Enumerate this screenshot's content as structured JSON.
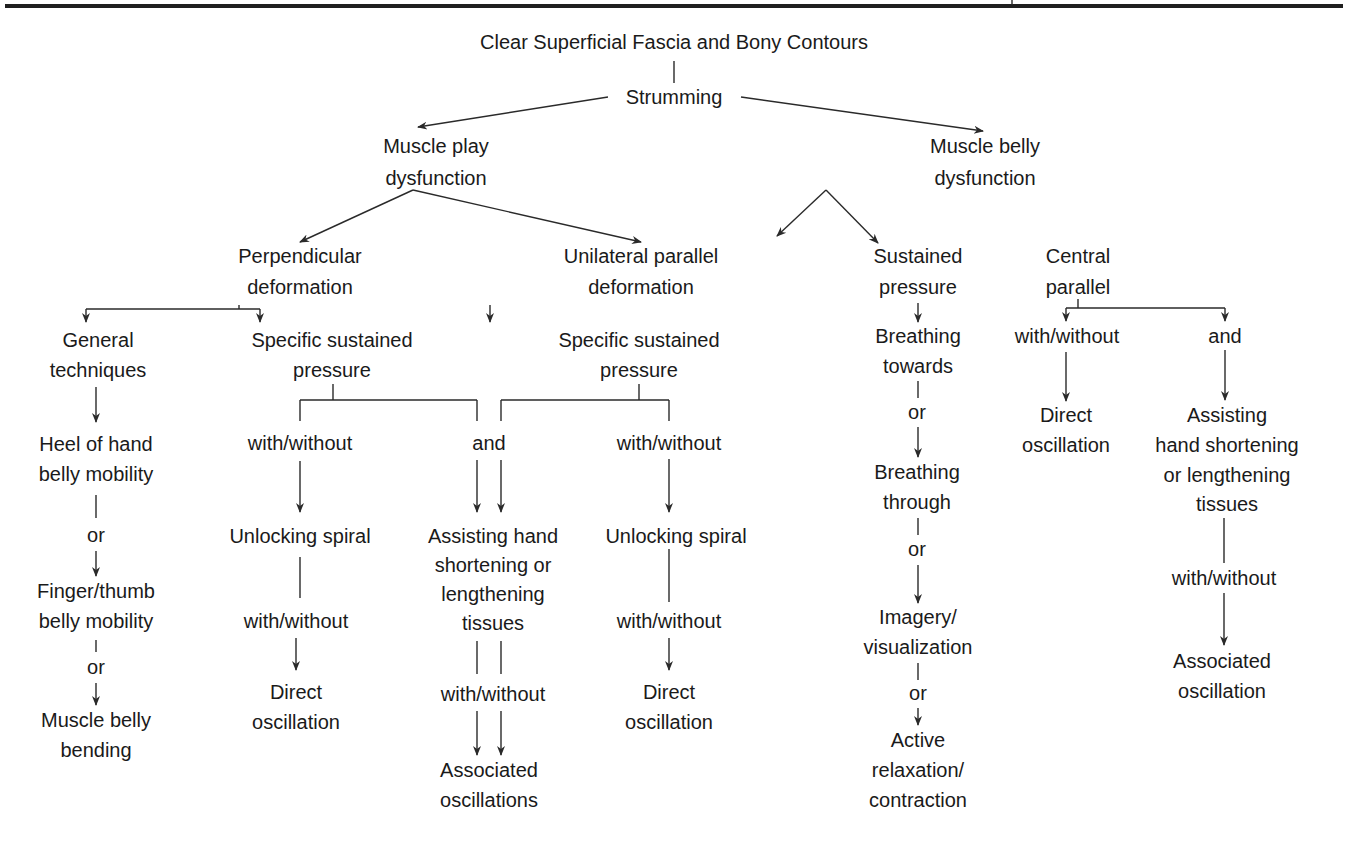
{
  "diagram": {
    "title": "Clear Superficial Fascia and Bony Contours",
    "strumming": "Strumming",
    "muscle_play": [
      "Muscle play",
      "dysfunction"
    ],
    "muscle_belly": [
      "Muscle belly",
      "dysfunction"
    ],
    "perpendicular": [
      "Perpendicular",
      "deformation"
    ],
    "unilateral": [
      "Unilateral parallel",
      "deformation"
    ],
    "general": [
      "General",
      "techniques"
    ],
    "specific_left": [
      "Specific sustained",
      "pressure"
    ],
    "specific_right": [
      "Specific sustained",
      "pressure"
    ],
    "heel": [
      "Heel of hand",
      "belly mobility"
    ],
    "or_1": "or",
    "finger": [
      "Finger/thumb",
      "belly mobility"
    ],
    "or_2": "or",
    "bending": [
      "Muscle belly",
      "bending"
    ],
    "ww_left": "with/without",
    "and_mid": "and",
    "ww_right": "with/without",
    "unlock_left": "Unlocking spiral",
    "assisting_mid": [
      "Assisting hand",
      "shortening or",
      "lengthening",
      "tissues"
    ],
    "unlock_right": "Unlocking spiral",
    "ww_left2": "with/without",
    "ww_mid2": "with/without",
    "ww_right2": "with/without",
    "direct_left": [
      "Direct",
      "oscillation"
    ],
    "assoc_mid": [
      "Associated",
      "oscillations"
    ],
    "direct_right": [
      "Direct",
      "oscillation"
    ],
    "sustained": [
      "Sustained",
      "pressure"
    ],
    "central": [
      "Central",
      "parallel"
    ],
    "breath_towards": [
      "Breathing",
      "towards"
    ],
    "or_3": "or",
    "breath_through": [
      "Breathing",
      "through"
    ],
    "or_4": "or",
    "imagery": [
      "Imagery/",
      "visualization"
    ],
    "or_5": "or",
    "active": [
      "Active",
      "relaxation/",
      "contraction"
    ],
    "ww_central": "with/without",
    "and_central": "and",
    "direct_central": [
      "Direct",
      "oscillation"
    ],
    "assisting_right": [
      "Assisting",
      "hand shortening",
      "or lengthening",
      "tissues"
    ],
    "ww_right3": "with/without",
    "assoc_right": [
      "Associated",
      "oscillation"
    ]
  }
}
